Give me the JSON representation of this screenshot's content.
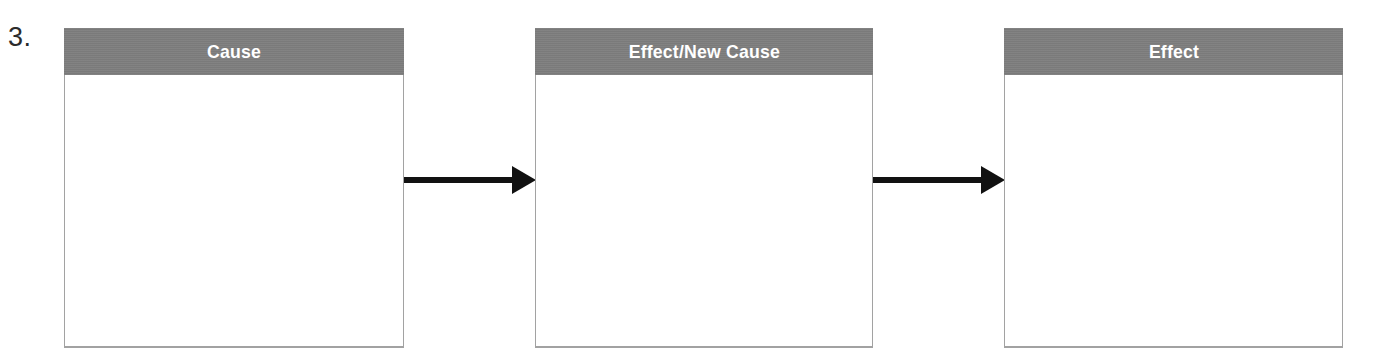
{
  "worksheet": {
    "item_number": "3.",
    "background_color": "#ffffff",
    "header_fill_color": "#7e7e7e",
    "header_text_color": "#ffffff",
    "box_border_color": "#a2a2a2",
    "arrow_color": "#111111"
  },
  "boxes": [
    {
      "id": "cause",
      "label": "Cause"
    },
    {
      "id": "effect-new-cause",
      "label": "Effect/New Cause"
    },
    {
      "id": "effect",
      "label": "Effect"
    }
  ],
  "arrows": [
    {
      "id": "arrow-cause-to-effect-new-cause",
      "direction": "right"
    },
    {
      "id": "arrow-effect-new-cause-to-effect",
      "direction": "right"
    }
  ]
}
